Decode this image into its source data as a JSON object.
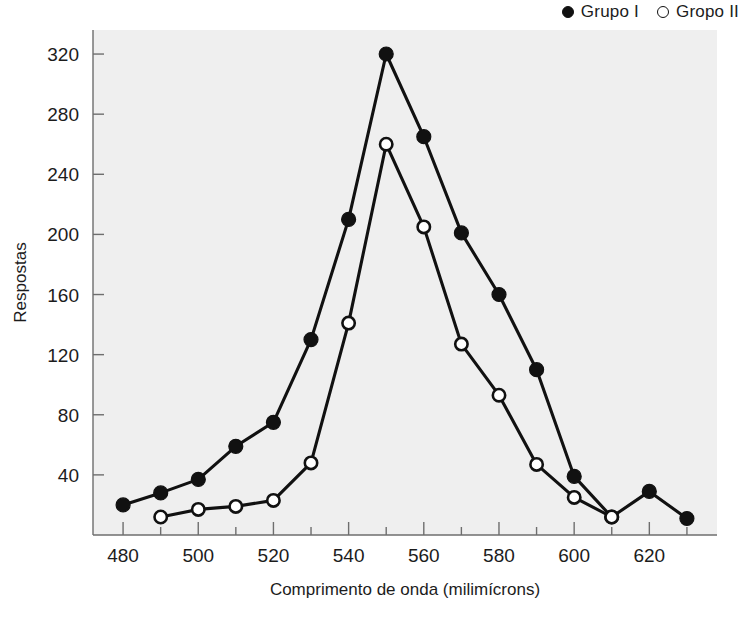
{
  "legend": {
    "position": "top-right",
    "entries": [
      {
        "label": "Grupo I",
        "marker": "filled-circle-icon"
      },
      {
        "label": "Gropo II",
        "marker": "open-circle-icon"
      }
    ]
  },
  "chart_data": {
    "type": "line",
    "title": "",
    "xlabel": "Comprimento de onda (milimícrons)",
    "ylabel": "Respostas",
    "x": [
      480,
      490,
      500,
      510,
      520,
      530,
      540,
      550,
      560,
      570,
      580,
      590,
      600,
      610,
      620,
      630
    ],
    "xlim": [
      472,
      638
    ],
    "ylim": [
      0,
      336
    ],
    "xticks": [
      480,
      500,
      520,
      540,
      560,
      580,
      600,
      620
    ],
    "xticklabels": [
      "480",
      "500",
      "520",
      "540",
      "560",
      "580",
      "600",
      "620"
    ],
    "xminorticks": [
      490,
      510,
      530,
      550,
      570,
      590,
      610,
      630
    ],
    "yticks": [
      40,
      80,
      120,
      160,
      200,
      240,
      280,
      320
    ],
    "yticklabels": [
      "40",
      "80",
      "120",
      "160",
      "200",
      "240",
      "280",
      "320"
    ],
    "grid": false,
    "plot_background": "#efefef",
    "series": [
      {
        "name": "Grupo I",
        "marker": "filled-circle",
        "color": "#111111",
        "x": [
          480,
          490,
          500,
          510,
          520,
          530,
          540,
          550,
          560,
          570,
          580,
          590,
          600,
          610,
          620,
          630
        ],
        "values": [
          20,
          28,
          37,
          59,
          75,
          130,
          210,
          320,
          265,
          201,
          160,
          110,
          39,
          12,
          29,
          11
        ]
      },
      {
        "name": "Gropo II",
        "marker": "open-circle",
        "color": "#111111",
        "x": [
          490,
          500,
          510,
          520,
          530,
          540,
          550,
          560,
          570,
          580,
          590,
          600,
          610
        ],
        "values": [
          12,
          17,
          19,
          23,
          48,
          141,
          260,
          205,
          127,
          93,
          47,
          25,
          12
        ]
      }
    ]
  }
}
